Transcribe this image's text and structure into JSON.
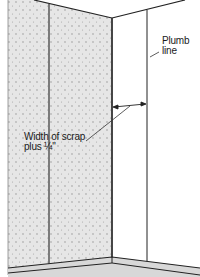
{
  "diagram": {
    "labels": {
      "plumb_line_1": "Plumb",
      "plumb_line_2": "line",
      "width_scrap_1": "Width of scrap",
      "width_scrap_2": "plus ¼\""
    },
    "colors": {
      "panel_fill": "#e4e4e4",
      "panel_dots": "#9a9a9a",
      "line": "#222222",
      "wall_right": "#ffffff",
      "floor": "#d8d8d8"
    }
  }
}
